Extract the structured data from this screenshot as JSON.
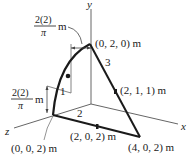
{
  "figure": {
    "axes": {
      "x": "x",
      "y": "y",
      "z": "z"
    },
    "points": {
      "p_top": "(0, 2, 0) m",
      "p_mid": "(2, 1, 1) m",
      "p_bottom_left": "(0, 0, 2) m",
      "p_bottom_mid": "(2, 0, 2) m",
      "p_bottom_right": "(4, 0, 2) m"
    },
    "segments": {
      "s1": "1",
      "s2": "2",
      "s3": "3"
    },
    "dimensions": {
      "top": {
        "numerator": "2(2)",
        "denominator": "π",
        "unit": "m"
      },
      "left": {
        "numerator": "2(2)",
        "denominator": "π",
        "unit": "m"
      }
    },
    "colors": {
      "line": "#1a1a1a",
      "axis": "#555555",
      "bg": "#ffffff"
    }
  }
}
